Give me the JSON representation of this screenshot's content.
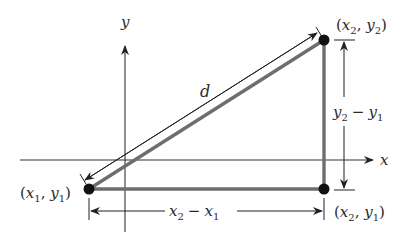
{
  "diagram": {
    "axes": {
      "x_label": "x",
      "y_label": "y"
    },
    "points": [
      {
        "id": "p1",
        "label_var1": "x",
        "label_sub1": "1",
        "label_var2": "y",
        "label_sub2": "1"
      },
      {
        "id": "p2",
        "label_var1": "x",
        "label_sub1": "2",
        "label_var2": "y",
        "label_sub2": "2"
      },
      {
        "id": "p3",
        "label_var1": "x",
        "label_sub1": "2",
        "label_var2": "y",
        "label_sub2": "1"
      }
    ],
    "distance_label": "d",
    "horizontal_dim": {
      "a": "x",
      "a_sub": "2",
      "op": "−",
      "b": "x",
      "b_sub": "1"
    },
    "vertical_dim": {
      "a": "y",
      "a_sub": "2",
      "op": "−",
      "b": "y",
      "b_sub": "1"
    },
    "colors": {
      "triangle": "#6e6e6e",
      "axis": "#333333",
      "point": "#111111",
      "text": "#2a2a2a"
    }
  }
}
